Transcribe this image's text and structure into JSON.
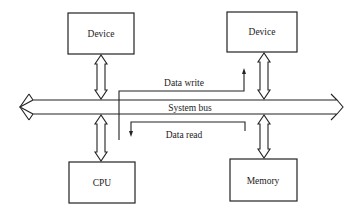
{
  "diagram": {
    "nodes": [
      {
        "id": "device-left",
        "label": "Device"
      },
      {
        "id": "device-right",
        "label": "Device"
      },
      {
        "id": "cpu",
        "label": "CPU"
      },
      {
        "id": "memory",
        "label": "Memory"
      }
    ],
    "bus": {
      "label": "System bus"
    },
    "flows": [
      {
        "label": "Data write",
        "from": "cpu",
        "to": "device-right"
      },
      {
        "label": "Data read",
        "from": "memory",
        "to": "cpu"
      }
    ],
    "colors": {
      "stroke": "#222222",
      "background": "#ffffff"
    }
  }
}
